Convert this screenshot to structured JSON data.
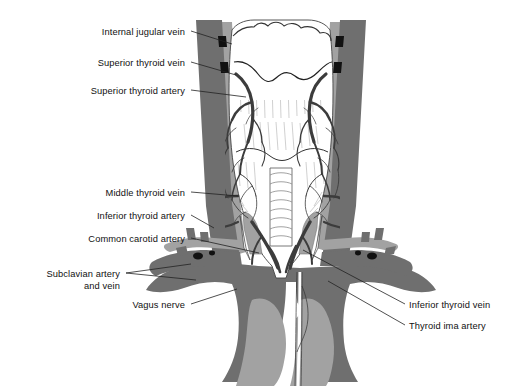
{
  "figure": {
    "type": "anatomical-illustration",
    "style": "grayscale line drawing",
    "background_color": "#ffffff",
    "palette": {
      "vein_dark_gray": "#6f6f6f",
      "artery_mid_gray": "#a2a2a2",
      "vessel_outline": "#3a3a3a",
      "gland_white": "#ffffff",
      "hatch_line": "#9a9a9a",
      "leader_line": "#2b2b2b",
      "text": "#111111"
    }
  },
  "labels_left": [
    {
      "id": "internal-jugular-vein",
      "text": "Internal jugular vein",
      "x": 185,
      "y": 27,
      "lx1": 191,
      "ly1": 31,
      "lx2": 232,
      "ly2": 44
    },
    {
      "id": "superior-thyroid-vein",
      "text": "Superior thyroid vein",
      "x": 185,
      "y": 58,
      "lx1": 191,
      "ly1": 62,
      "lx2": 236,
      "ly2": 75
    },
    {
      "id": "superior-thyroid-artery",
      "text": "Superior thyroid artery",
      "x": 185,
      "y": 86,
      "lx1": 191,
      "ly1": 90,
      "lx2": 246,
      "ly2": 97
    },
    {
      "id": "middle-thyroid-vein",
      "text": "Middle thyroid vein",
      "x": 185,
      "y": 188,
      "lx1": 191,
      "ly1": 192,
      "lx2": 238,
      "ly2": 196
    },
    {
      "id": "inferior-thyroid-artery",
      "text": "Inferior thyroid artery",
      "x": 185,
      "y": 211,
      "lx1": 191,
      "ly1": 215,
      "lx2": 214,
      "ly2": 228
    },
    {
      "id": "common-carotid-artery",
      "text": "Common carotid artery",
      "x": 185,
      "y": 234,
      "lx1": 191,
      "ly1": 238,
      "lx2": 259,
      "ly2": 253
    },
    {
      "id": "subclavian-artery-vein",
      "text": "Subclavian artery\nand vein",
      "x": 120,
      "y": 269,
      "lx1": 126,
      "ly1": 273,
      "lx2": 191,
      "ly2": 264
    },
    {
      "id": "vagus-nerve",
      "text": "Vagus nerve",
      "x": 185,
      "y": 300,
      "lx1": 191,
      "ly1": 304,
      "lx2": 237,
      "ly2": 289
    }
  ],
  "labels_right": [
    {
      "id": "inferior-thyroid-vein",
      "text": "Inferior thyroid vein",
      "x": 409,
      "y": 300,
      "lx1": 405,
      "ly1": 304,
      "lx2": 303,
      "ly2": 250
    },
    {
      "id": "thyroid-ima-artery",
      "text": "Thyroid ima artery",
      "x": 409,
      "y": 321,
      "lx1": 405,
      "ly1": 325,
      "lx2": 328,
      "ly2": 281
    }
  ],
  "structures": [
    {
      "name": "larynx-thyroid-cartilage",
      "tone": "white-outline"
    },
    {
      "name": "thyroid-gland",
      "tone": "white-hatched"
    },
    {
      "name": "trachea",
      "tone": "white-ringed"
    },
    {
      "name": "internal-jugular-vein",
      "tone": "dark-gray"
    },
    {
      "name": "common-carotid-artery",
      "tone": "mid-gray"
    },
    {
      "name": "subclavian-vessels",
      "tone": "dark-gray"
    },
    {
      "name": "brachiocephalic-veins",
      "tone": "dark-gray"
    },
    {
      "name": "lung-apex",
      "tone": "mid-gray"
    },
    {
      "name": "thyroid-ima-artery",
      "tone": "white-outline"
    },
    {
      "name": "thyroidal-vessel-network",
      "tone": "dark-outline"
    }
  ]
}
